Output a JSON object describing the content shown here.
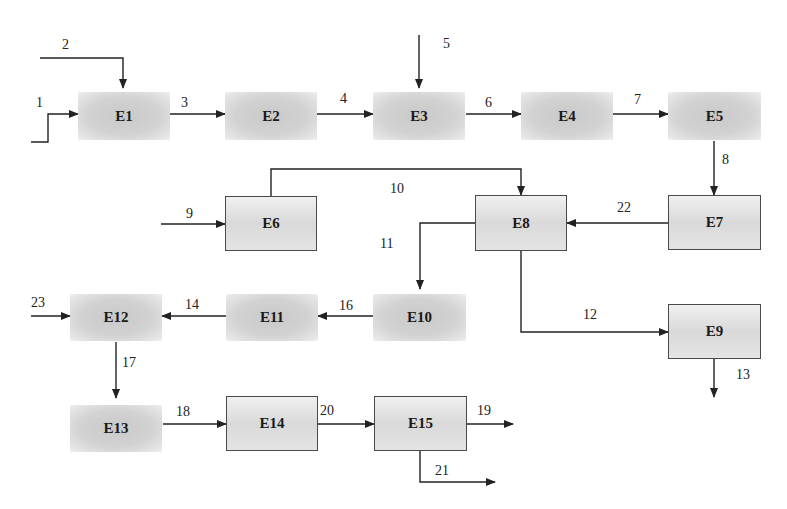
{
  "diagram": {
    "type": "process-flow",
    "units": [
      {
        "id": "E1",
        "label": "E1"
      },
      {
        "id": "E2",
        "label": "E2"
      },
      {
        "id": "E3",
        "label": "E3"
      },
      {
        "id": "E4",
        "label": "E4"
      },
      {
        "id": "E5",
        "label": "E5"
      },
      {
        "id": "E6",
        "label": "E6"
      },
      {
        "id": "E7",
        "label": "E7"
      },
      {
        "id": "E8",
        "label": "E8"
      },
      {
        "id": "E9",
        "label": "E9"
      },
      {
        "id": "E10",
        "label": "E10"
      },
      {
        "id": "E11",
        "label": "E11"
      },
      {
        "id": "E12",
        "label": "E12"
      },
      {
        "id": "E13",
        "label": "E13"
      },
      {
        "id": "E14",
        "label": "E14"
      },
      {
        "id": "E15",
        "label": "E15"
      }
    ],
    "streams": [
      {
        "label": "1",
        "from": null,
        "to": "E1"
      },
      {
        "label": "2",
        "from": null,
        "to": "E1"
      },
      {
        "label": "3",
        "from": "E1",
        "to": "E2"
      },
      {
        "label": "4",
        "from": "E2",
        "to": "E3"
      },
      {
        "label": "5",
        "from": null,
        "to": "E3"
      },
      {
        "label": "6",
        "from": "E3",
        "to": "E4"
      },
      {
        "label": "7",
        "from": "E4",
        "to": "E5"
      },
      {
        "label": "8",
        "from": "E5",
        "to": "E7"
      },
      {
        "label": "9",
        "from": null,
        "to": "E6"
      },
      {
        "label": "10",
        "from": "E6",
        "to": "E8"
      },
      {
        "label": "11",
        "from": "E8",
        "to": "E10"
      },
      {
        "label": "12",
        "from": "E8",
        "to": "E9"
      },
      {
        "label": "13",
        "from": "E9",
        "to": null
      },
      {
        "label": "14",
        "from": "E11",
        "to": "E12"
      },
      {
        "label": "16",
        "from": "E10",
        "to": "E11"
      },
      {
        "label": "17",
        "from": "E12",
        "to": "E13"
      },
      {
        "label": "18",
        "from": "E13",
        "to": "E14"
      },
      {
        "label": "19",
        "from": "E15",
        "to": null
      },
      {
        "label": "20",
        "from": "E14",
        "to": "E15"
      },
      {
        "label": "21",
        "from": "E15",
        "to": null
      },
      {
        "label": "22",
        "from": "E7",
        "to": "E8"
      },
      {
        "label": "23",
        "from": null,
        "to": "E12"
      }
    ]
  },
  "colors": {
    "line": "#222222",
    "box_border": "#4a4a4a",
    "box_fill": "#d6d6d6"
  }
}
